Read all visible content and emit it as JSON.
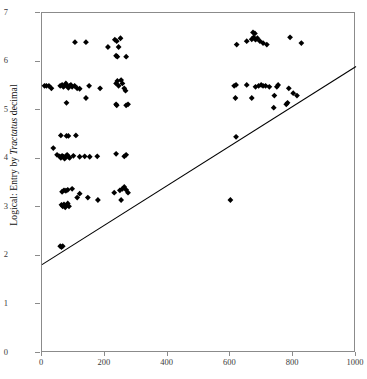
{
  "chart_data": {
    "type": "scatter",
    "title": "",
    "xlabel": "",
    "ylabel": "Logical: Entry by Tractatus decimal",
    "ylabel_plain": "Logical: Entry by ",
    "ylabel_italic": "Tractatus",
    "ylabel_tail": " decimal",
    "xlim": [
      0,
      1000
    ],
    "ylim": [
      0,
      7
    ],
    "xticks": [
      0,
      200,
      400,
      600,
      800,
      1000
    ],
    "yticks": [
      0,
      1,
      2,
      3,
      4,
      5,
      6,
      7
    ],
    "xtick_labels": [
      "0",
      "200",
      "400",
      "600",
      "800",
      "1000"
    ],
    "ytick_labels": [
      "0",
      "1",
      "2",
      "3",
      "4",
      "5",
      "6",
      "7"
    ],
    "grid": false,
    "legend": "none",
    "marker": "diamond",
    "marker_color": "#000000",
    "marker_size": 4,
    "frame_color": "#8b8b8b",
    "background": "#ffffff",
    "reference_line": {
      "name": "diagonal-reference-line",
      "color": "#000000",
      "width": 1.1,
      "x": [
        0,
        1000
      ],
      "y": [
        1.82,
        5.9
      ]
    },
    "points": [
      [
        8,
        5.5
      ],
      [
        14,
        5.5
      ],
      [
        22,
        5.5
      ],
      [
        30,
        5.45
      ],
      [
        58,
        5.5
      ],
      [
        64,
        5.52
      ],
      [
        68,
        5.48
      ],
      [
        72,
        5.5
      ],
      [
        76,
        5.55
      ],
      [
        80,
        5.5
      ],
      [
        84,
        5.46
      ],
      [
        88,
        5.5
      ],
      [
        92,
        5.52
      ],
      [
        96,
        5.48
      ],
      [
        104,
        5.5
      ],
      [
        112,
        5.45
      ],
      [
        120,
        5.44
      ],
      [
        150,
        5.5
      ],
      [
        185,
        5.45
      ],
      [
        78,
        5.15
      ],
      [
        140,
        5.25
      ],
      [
        105,
        6.4
      ],
      [
        140,
        6.4
      ],
      [
        210,
        6.3
      ],
      [
        232,
        6.45
      ],
      [
        238,
        6.42
      ],
      [
        244,
        6.3
      ],
      [
        250,
        6.48
      ],
      [
        236,
        6.12
      ],
      [
        240,
        6.1
      ],
      [
        268,
        6.1
      ],
      [
        236,
        5.55
      ],
      [
        240,
        5.6
      ],
      [
        244,
        5.5
      ],
      [
        252,
        5.62
      ],
      [
        256,
        5.55
      ],
      [
        262,
        5.45
      ],
      [
        266,
        5.4
      ],
      [
        236,
        5.12
      ],
      [
        238,
        5.1
      ],
      [
        268,
        5.1
      ],
      [
        274,
        5.12
      ],
      [
        60,
        4.48
      ],
      [
        78,
        4.47
      ],
      [
        84,
        4.47
      ],
      [
        108,
        4.48
      ],
      [
        36,
        4.22
      ],
      [
        48,
        4.08
      ],
      [
        56,
        4.05
      ],
      [
        60,
        4.02
      ],
      [
        64,
        4.06
      ],
      [
        68,
        4.04
      ],
      [
        72,
        4.0
      ],
      [
        76,
        4.05
      ],
      [
        80,
        4.08
      ],
      [
        84,
        4.04
      ],
      [
        88,
        4.02
      ],
      [
        100,
        4.06
      ],
      [
        120,
        4.04
      ],
      [
        136,
        4.05
      ],
      [
        152,
        4.04
      ],
      [
        176,
        4.05
      ],
      [
        236,
        4.1
      ],
      [
        262,
        4.05
      ],
      [
        268,
        4.08
      ],
      [
        64,
        3.32
      ],
      [
        70,
        3.35
      ],
      [
        76,
        3.34
      ],
      [
        82,
        3.36
      ],
      [
        96,
        3.38
      ],
      [
        120,
        3.28
      ],
      [
        146,
        3.2
      ],
      [
        62,
        3.05
      ],
      [
        66,
        3.02
      ],
      [
        70,
        3.06
      ],
      [
        74,
        3.0
      ],
      [
        78,
        3.04
      ],
      [
        82,
        3.08
      ],
      [
        86,
        3.02
      ],
      [
        112,
        3.2
      ],
      [
        178,
        3.15
      ],
      [
        230,
        3.3
      ],
      [
        248,
        3.35
      ],
      [
        256,
        3.38
      ],
      [
        262,
        3.42
      ],
      [
        268,
        3.36
      ],
      [
        274,
        3.3
      ],
      [
        252,
        3.15
      ],
      [
        58,
        2.2
      ],
      [
        62,
        2.18
      ],
      [
        66,
        2.2
      ],
      [
        600,
        3.15
      ],
      [
        620,
        6.35
      ],
      [
        652,
        6.42
      ],
      [
        668,
        6.46
      ],
      [
        674,
        6.5
      ],
      [
        680,
        6.45
      ],
      [
        686,
        6.48
      ],
      [
        694,
        6.42
      ],
      [
        704,
        6.38
      ],
      [
        716,
        6.35
      ],
      [
        672,
        6.6
      ],
      [
        678,
        6.58
      ],
      [
        790,
        6.5
      ],
      [
        826,
        6.38
      ],
      [
        612,
        5.5
      ],
      [
        618,
        5.52
      ],
      [
        652,
        5.52
      ],
      [
        680,
        5.48
      ],
      [
        690,
        5.5
      ],
      [
        698,
        5.52
      ],
      [
        704,
        5.5
      ],
      [
        712,
        5.5
      ],
      [
        724,
        5.48
      ],
      [
        748,
        5.48
      ],
      [
        752,
        5.52
      ],
      [
        786,
        5.45
      ],
      [
        616,
        5.25
      ],
      [
        668,
        5.25
      ],
      [
        740,
        5.3
      ],
      [
        738,
        5.05
      ],
      [
        778,
        5.12
      ],
      [
        782,
        5.15
      ],
      [
        800,
        5.35
      ],
      [
        812,
        5.3
      ],
      [
        618,
        4.45
      ]
    ]
  }
}
